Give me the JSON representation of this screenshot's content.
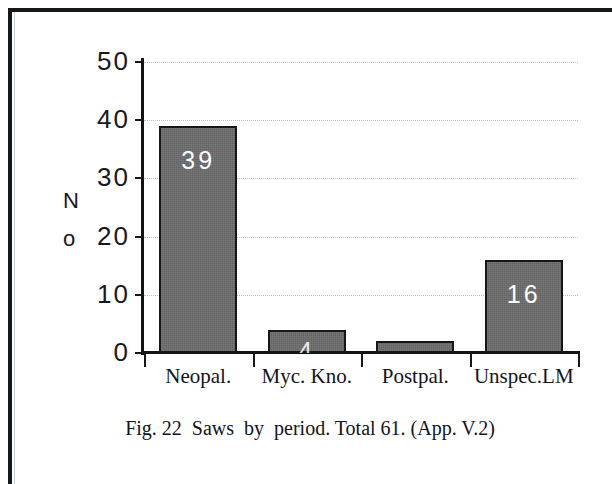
{
  "figure": {
    "caption": "Fig. 22  Saws  by  period. Total 61. (App. V.2)",
    "frame_color": "#15171a",
    "bar_color": "#6c6c6c",
    "bar_outline_color": "#141618",
    "value_label_color": "#ffffff",
    "gridline_color": "#b9bcc0",
    "axis_color": "#111315"
  },
  "chart_data": {
    "type": "bar",
    "title": "",
    "subtitle": "",
    "categories": [
      "Neopal.",
      "Myc. Kno.",
      "Postpal.",
      "Unspec.LM"
    ],
    "values": [
      39,
      4,
      2,
      16
    ],
    "data_labels": [
      "39",
      "4",
      "",
      "16"
    ],
    "data_label_visible": [
      true,
      true,
      false,
      true
    ],
    "xlabel": "",
    "ylabel": "No",
    "ylabel_chars": [
      "N",
      "o"
    ],
    "ylim": [
      0,
      50
    ],
    "yticks": [
      0,
      10,
      20,
      30,
      40,
      50
    ],
    "ytick_labels": [
      "0",
      "10",
      "20",
      "30",
      "40",
      "50"
    ],
    "grid": true,
    "grid_axis": "y",
    "legend": false,
    "legend_position": "none",
    "total": 61,
    "annotations": [
      "Fig. 22  Saws  by  period. Total 61. (App. V.2)"
    ]
  }
}
